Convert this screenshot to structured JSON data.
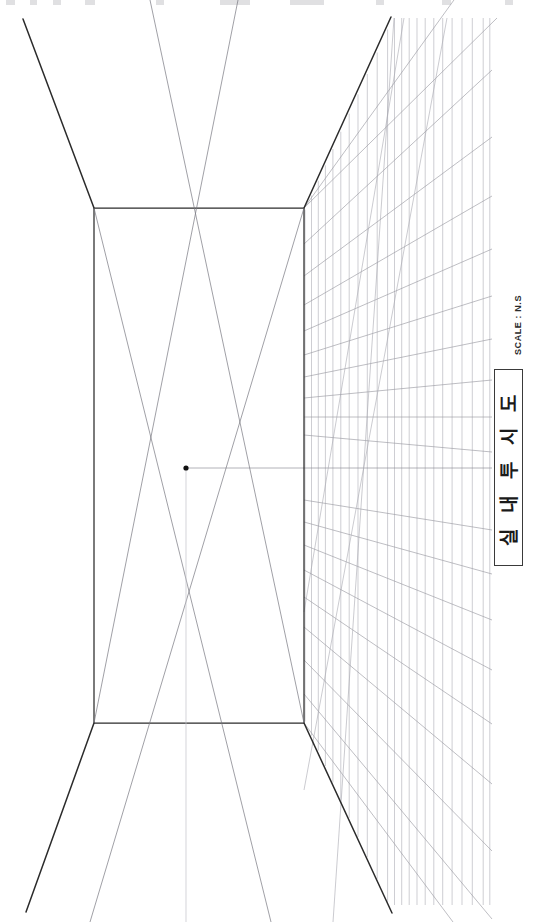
{
  "sheet": {
    "width": 543,
    "height": 922,
    "background": "#ffffff",
    "ink_dark": "#2b2b2b",
    "ink_medium": "#6e6e76",
    "ink_light": "#b9b9c0",
    "ink_faint": "#d2d2d8"
  },
  "title_block": {
    "caption": "실 내 투 시 도",
    "caption_plain": "실내투시도",
    "border_color": "#3a3a3a",
    "orientation": "rotated-90-ccw"
  },
  "scale": {
    "label": "SCALE : N.S",
    "orientation": "rotated-90-ccw"
  },
  "drawing": {
    "type": "one-point-perspective-interior",
    "vanishing_point": {
      "x": 186,
      "y": 468
    },
    "back_wall_rect": {
      "left": 94,
      "top": 208,
      "right": 304,
      "bottom": 723
    },
    "ceiling_edge_left": {
      "x1": 94,
      "y1": 208,
      "x2": 23,
      "y2": 19
    },
    "ceiling_edge_right": {
      "x1": 304,
      "y1": 208,
      "x2": 391,
      "y2": 17
    },
    "floor_edge_left": {
      "x1": 94,
      "y1": 723,
      "x2": 26,
      "y2": 912
    },
    "floor_edge_right": {
      "x1": 304,
      "y1": 723,
      "x2": 392,
      "y2": 913
    },
    "grid": {
      "region": "right-side-wall",
      "vertical_line_count": 26,
      "receding_line_count": 17,
      "left_edge_x": 304,
      "right_edge_x": 490,
      "top_y": 18,
      "bottom_y": 905
    },
    "center_axis_visible": true,
    "horizon_line_visible": true
  }
}
